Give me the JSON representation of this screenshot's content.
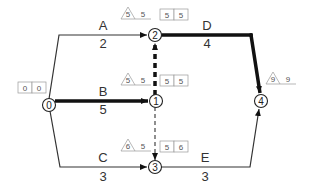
{
  "diagram": {
    "type": "activity-on-arrow network",
    "nodes": [
      {
        "id": "0",
        "label": "0",
        "x": 49,
        "y": 105
      },
      {
        "id": "1",
        "label": "1",
        "x": 156,
        "y": 101
      },
      {
        "id": "2",
        "label": "2",
        "x": 155,
        "y": 35
      },
      {
        "id": "3",
        "label": "3",
        "x": 155,
        "y": 167
      },
      {
        "id": "4",
        "label": "4",
        "x": 261,
        "y": 101
      }
    ],
    "activities": [
      {
        "name": "A",
        "duration": "2",
        "from": "0",
        "to": "2",
        "critical": false
      },
      {
        "name": "B",
        "duration": "5",
        "from": "0",
        "to": "1",
        "critical": true
      },
      {
        "name": "C",
        "duration": "3",
        "from": "0",
        "to": "3",
        "critical": false
      },
      {
        "name": "D",
        "duration": "4",
        "from": "2",
        "to": "4",
        "critical": true
      },
      {
        "name": "E",
        "duration": "3",
        "from": "3",
        "to": "4",
        "critical": false
      }
    ],
    "dummies": [
      {
        "from": "1",
        "to": "2",
        "critical": true
      },
      {
        "from": "1",
        "to": "3",
        "critical": false
      }
    ],
    "node_times": {
      "0": {
        "box": [
          "0",
          "0"
        ]
      },
      "1": {
        "triangle": "5",
        "tri_value": "5",
        "box": [
          "5",
          "5"
        ]
      },
      "2": {
        "triangle": "5",
        "tri_value": "5",
        "box": [
          "5",
          "5"
        ]
      },
      "3": {
        "triangle": "6",
        "tri_value": "5",
        "box": [
          "5",
          "6"
        ]
      },
      "4": {
        "triangle": "9",
        "tri_value": "9"
      }
    }
  }
}
